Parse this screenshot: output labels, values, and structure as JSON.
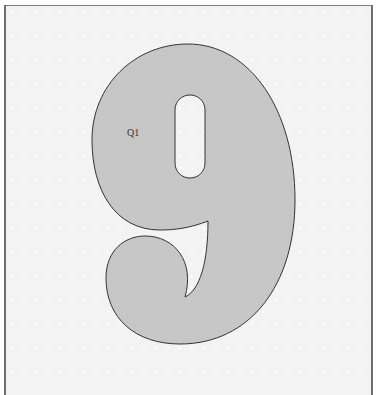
{
  "figure": {
    "glyph": "9",
    "label": "Q1",
    "colors": {
      "fill": "#c8c8c8",
      "stroke": "#333333",
      "background": "#f3f3f3",
      "frame_border": "#6e6e6e"
    }
  }
}
